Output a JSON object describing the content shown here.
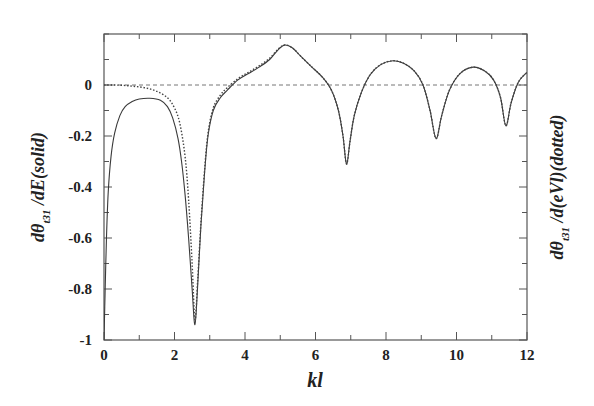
{
  "chart_data": {
    "type": "line",
    "title": "",
    "xlabel": "kl",
    "ylabel_left": "dθ_t31 /dE(solid)",
    "ylabel_right": "dθ_t31 /d(eVl)(dotted)",
    "xlim": [
      0,
      12
    ],
    "ylim": [
      -1,
      0.2
    ],
    "x_ticks": [
      0,
      2,
      4,
      6,
      8,
      10,
      12
    ],
    "x_tick_labels": [
      "0",
      "2",
      "4",
      "6",
      "8",
      "10",
      "12"
    ],
    "x_minor_step": 1,
    "y_ticks": [
      -1,
      -0.8,
      -0.6,
      -0.4,
      -0.2,
      0
    ],
    "y_tick_labels": [
      "-1",
      "-0.8",
      "-0.6",
      "-0.4",
      "-0.2",
      "0"
    ],
    "y_minor_step": 0.1,
    "grid": false,
    "reference_line": {
      "y": 0,
      "style": "dashed"
    },
    "series": [
      {
        "name": "solid",
        "style": "solid",
        "x": [
          0.0,
          0.03,
          0.07,
          0.12,
          0.2,
          0.3,
          0.45,
          0.6,
          0.8,
          1.0,
          1.3,
          1.6,
          1.8,
          1.95,
          2.1,
          2.2,
          2.3,
          2.4,
          2.5,
          2.58,
          2.66,
          2.75,
          2.85,
          2.95,
          3.1,
          3.3,
          3.5,
          3.8,
          4.1,
          4.4,
          4.7,
          4.95,
          5.13,
          5.35,
          5.6,
          5.9,
          6.2,
          6.45,
          6.65,
          6.78,
          6.88,
          6.98,
          7.1,
          7.3,
          7.55,
          7.85,
          8.2,
          8.5,
          8.8,
          9.05,
          9.25,
          9.42,
          9.58,
          9.8,
          10.1,
          10.47,
          10.8,
          11.05,
          11.25,
          11.4,
          11.55,
          11.75,
          12.0
        ],
        "y": [
          -1.0,
          -0.82,
          -0.6,
          -0.42,
          -0.28,
          -0.19,
          -0.12,
          -0.085,
          -0.065,
          -0.055,
          -0.052,
          -0.06,
          -0.085,
          -0.13,
          -0.21,
          -0.3,
          -0.43,
          -0.6,
          -0.8,
          -0.94,
          -0.78,
          -0.55,
          -0.35,
          -0.2,
          -0.1,
          -0.05,
          -0.02,
          0.02,
          0.045,
          0.07,
          0.1,
          0.14,
          0.157,
          0.145,
          0.11,
          0.07,
          0.03,
          -0.02,
          -0.1,
          -0.2,
          -0.31,
          -0.22,
          -0.12,
          -0.03,
          0.04,
          0.08,
          0.095,
          0.085,
          0.055,
          0.0,
          -0.1,
          -0.21,
          -0.12,
          -0.02,
          0.045,
          0.07,
          0.055,
          0.02,
          -0.05,
          -0.16,
          -0.07,
          0.01,
          0.05
        ]
      },
      {
        "name": "dotted",
        "style": "dotted",
        "x": [
          0.0,
          0.3,
          0.6,
          0.9,
          1.2,
          1.5,
          1.8,
          2.0,
          2.15,
          2.3,
          2.4,
          2.5,
          2.58,
          2.66,
          2.75,
          2.85,
          2.95,
          3.1,
          3.3,
          3.5,
          3.8,
          4.1,
          4.4,
          4.7,
          4.95,
          5.13,
          5.35,
          5.6,
          5.9,
          6.2,
          6.45,
          6.65,
          6.78,
          6.88,
          6.98,
          7.1,
          7.3,
          7.55,
          7.85,
          8.2,
          8.5,
          8.8,
          9.05,
          9.25,
          9.42,
          9.58,
          9.8,
          10.1,
          10.47,
          10.8,
          11.05,
          11.25,
          11.4,
          11.55,
          11.75,
          12.0
        ],
        "y": [
          0.0,
          0.0,
          -0.002,
          -0.006,
          -0.012,
          -0.025,
          -0.05,
          -0.09,
          -0.15,
          -0.28,
          -0.45,
          -0.7,
          -0.92,
          -0.76,
          -0.54,
          -0.34,
          -0.19,
          -0.09,
          -0.04,
          -0.01,
          0.025,
          0.05,
          0.075,
          0.105,
          0.142,
          0.157,
          0.145,
          0.11,
          0.07,
          0.03,
          -0.02,
          -0.1,
          -0.2,
          -0.31,
          -0.22,
          -0.12,
          -0.03,
          0.04,
          0.08,
          0.095,
          0.085,
          0.055,
          0.0,
          -0.1,
          -0.21,
          -0.12,
          -0.02,
          0.045,
          0.07,
          0.055,
          0.02,
          -0.05,
          -0.16,
          -0.07,
          0.01,
          0.05
        ]
      }
    ],
    "legend": null
  },
  "labels": {
    "xlabel": "kl",
    "ylabel_left_main": "dθ",
    "ylabel_left_sub": "t31",
    "ylabel_left_rest": " /dE(solid)",
    "ylabel_right_main": "dθ",
    "ylabel_right_sub": "t31",
    "ylabel_right_rest": " /d(eVl)(dotted)"
  }
}
